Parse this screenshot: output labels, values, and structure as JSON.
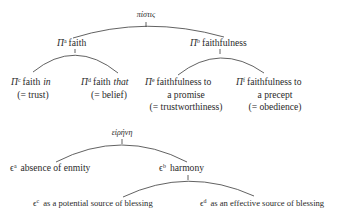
{
  "diagrams": [
    {
      "root": "πίστις",
      "nodes": {
        "a": {
          "symbol": "Π",
          "sup": "a",
          "label": "faith"
        },
        "b": {
          "symbol": "Π",
          "sup": "b",
          "label": "faithfulness"
        },
        "c": {
          "symbol": "Π",
          "sup": "c",
          "label": "faith",
          "emph": "in",
          "gloss": "(= trust)"
        },
        "d": {
          "symbol": "Π",
          "sup": "d",
          "label": "faith",
          "emph": "that",
          "gloss": "(= belief)"
        },
        "e": {
          "symbol": "Π",
          "sup": "e",
          "line1": "faithfulness to",
          "line2": "a promise",
          "gloss": "(= trustworthiness)"
        },
        "f": {
          "symbol": "Π",
          "sup": "f",
          "line1": "faithfulness to",
          "line2": "a precept",
          "gloss": "(= obedience)"
        }
      }
    },
    {
      "root": "εἰρήνη",
      "nodes": {
        "a": {
          "symbol": "ϵ",
          "sup": "a",
          "label": "absence of enmity"
        },
        "b": {
          "symbol": "ϵ",
          "sup": "b",
          "label": "harmony"
        },
        "c": {
          "symbol": "ϵ",
          "sup": "c",
          "label": "as a potential source of blessing"
        },
        "d": {
          "symbol": "ϵ",
          "sup": "d",
          "label": "as an effective source of blessing"
        }
      }
    }
  ]
}
